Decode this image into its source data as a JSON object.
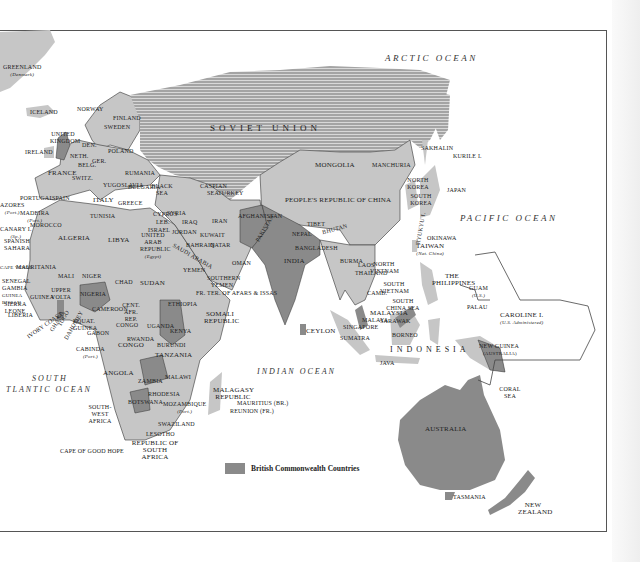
{
  "map": {
    "title": "British Commonwealth world map (Eastern Hemisphere)",
    "colors": {
      "land": "#c6c6c6",
      "commonwealth": "#8a8a8a",
      "soviet_hatch": "#9a9a9a",
      "ocean": "#ffffff",
      "border": "#333333"
    },
    "oceans": {
      "arctic": "ARCTIC OCEAN",
      "pacific": "PACIFIC OCEAN",
      "indian": "INDIAN OCEAN",
      "south_atlantic_1": "SOUTH",
      "south_atlantic_2": "TLANTIC OCEAN",
      "south_china_sea": "SOUTH CHINA SEA",
      "coral_sea": "CORAL SEA",
      "black_sea": "BLACK SEA",
      "caspian_sea": "CASPIAN SEA"
    },
    "labels": {
      "greenland": "GREENLAND",
      "greenland_sub": "(Denmark)",
      "iceland": "ICELAND",
      "norway": "NORWAY",
      "sweden": "SWEDEN",
      "finland": "FINLAND",
      "uk": "UNITED KINGDOM",
      "ireland": "IRELAND",
      "denmark": "DEN.",
      "poland": "POLAND",
      "neth": "NETH.",
      "belg": "BELG.",
      "ger": "GER.",
      "france": "FRANCE",
      "switz": "SWITZ.",
      "rumania": "RUMANIA",
      "yugoslavia": "YUGOSLAVIA",
      "bulgaria": "BULGARIA",
      "italy": "ITALY",
      "greece": "GREECE",
      "portugal": "PORTUGAL",
      "spain": "SPAIN",
      "soviet_union": "SOVIET UNION",
      "turkey": "TURKEY",
      "cyprus": "CYPRUS",
      "syria": "SYRIA",
      "leb": "LEB.",
      "israel": "ISRAEL",
      "iraq": "IRAQ",
      "iran": "IRAN",
      "jordan": "JORDAN",
      "kuwait": "KUWAIT",
      "bahrain": "BAHRAIN",
      "qatar": "QATAR",
      "saudi_arabia": "SAUDI ARABIA",
      "oman": "OMAN",
      "yemen": "YEMEN",
      "southern_yemen": "SOUTHERN YEMEN",
      "afars": "FR. TER. OF AFARS & ISSAS",
      "afghanistan": "AFGHANISTAN",
      "pakistan": "PAKISTAN",
      "india": "INDIA",
      "nepal": "NEPAL",
      "bhutan": "BHUTAN",
      "bangladesh": "BANGLADESH",
      "ceylon": "CEYLON",
      "tibet": "TIBET",
      "china": "PEOPLE'S REPUBLIC OF CHINA",
      "mongolia": "MONGOLIA",
      "manchuria": "MANCHURIA",
      "sakhalin": "SAKHALIN",
      "kurile": "KURILE I.",
      "north_korea": "NORTH KOREA",
      "south_korea": "SOUTH KOREA",
      "japan": "JAPAN",
      "ryukyu": "RYUKYU I.",
      "okinawa": "OKINAWA",
      "taiwan": "TAIWAN",
      "taiwan_sub": "(Nat. China)",
      "burma": "BURMA",
      "laos": "LAOS",
      "thailand": "THAILAND",
      "cambodia": "CAMB.",
      "north_vietnam": "NORTH VIETNAM",
      "south_vietnam": "SOUTH VIETNAM",
      "philippines": "THE PHILIPPINES",
      "guam": "GUAM",
      "guam_sub": "(U.S.)",
      "palau": "PALAU",
      "caroline": "CAROLINE I.",
      "caroline_sub": "(U.S. Administered)",
      "malaya": "MALAYA",
      "malaysia": "MALAYSIA",
      "singapore": "SINGAPORE",
      "sarawak": "SARAWAK",
      "borneo": "BORNEO",
      "sumatra": "SUMATRA",
      "java": "JAVA",
      "indonesia": "INDONESIA",
      "new_guinea": "NEW GUINEA",
      "australia_ad": "(AUSTRALIA)",
      "australia": "AUSTRALIA",
      "tasmania": "TASMANIA",
      "new_zealand": "NEW ZEALAND",
      "azores": "AZORES",
      "azores_sub": "(Port.)",
      "madeira": "MADEIRA",
      "madeira_sub": "(Port.)",
      "canary": "CANARY I.",
      "canary_sub": "(Sp.)",
      "morocco": "MOROCCO",
      "tunisia": "TUNISIA",
      "algeria": "ALGERIA",
      "libya": "LIBYA",
      "uar": "UNITED ARAB REPUBLIC",
      "uar_sub": "(Egypt)",
      "spanish_sahara": "SPANISH SAHARA",
      "mauritania": "MAURITANIA",
      "cape_verde": "CAPE VERDE",
      "mali": "MALI",
      "niger": "NIGER",
      "chad": "CHAD",
      "sudan": "SUDAN",
      "ethiopia": "ETHIOPIA",
      "somali": "SOMALI REPUBLIC",
      "senegal": "SENEGAL",
      "gambia": "GAMBIA",
      "guinea_bissau": "GUINEA BISSAU",
      "guinea": "GUINEA",
      "sierra_leone": "SIERRA LEONE",
      "liberia": "LIBERIA",
      "ivory_coast": "IVORY COAST",
      "ghana": "GHANA",
      "togo": "TOGO",
      "dahomey": "DAHOMEY",
      "upper_volta": "UPPER VOLTA",
      "nigeria": "NIGERIA",
      "cameroon": "CAMEROON",
      "car": "CENT. AFR. REP.",
      "eq_guinea": "EQUAT. GUINEA",
      "gabon": "GABON",
      "congo1": "CONGO",
      "congo2": "CONGO",
      "uganda": "UGANDA",
      "kenya": "KENYA",
      "rwanda": "RWANDA",
      "burundi": "BURUNDI",
      "tanzania": "TANZANIA",
      "cabinda": "CABINDA",
      "cabinda_sub": "(Port.)",
      "angola": "ANGOLA",
      "zambia": "ZAMBIA",
      "malawi": "MALAWI",
      "rhodesia": "RHODESIA",
      "mozambique": "MOZAMBIQUE",
      "mozambique_sub": "(Port.)",
      "sw_africa": "SOUTH-WEST AFRICA",
      "botswana": "BOTSWANA",
      "swaziland": "SWAZILAND",
      "lesotho": "LESOTHO",
      "south_africa": "REPUBLIC OF SOUTH AFRICA",
      "cape": "CAPE OF GOOD HOPE",
      "malagasy": "MALAGASY REPUBLIC",
      "mauritius": "MAURITIUS (Br.)",
      "reunion": "REUNION (Fr.)"
    },
    "legend": {
      "label": "British Commonwealth Countries",
      "swatch_color": "#8a8a8a"
    }
  }
}
